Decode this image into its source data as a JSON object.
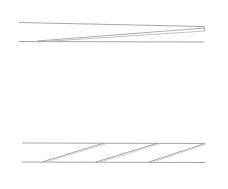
{
  "document": {
    "title": "Technical Line Drawing",
    "width": 228,
    "height": 189,
    "background_color": "#ffffff",
    "stroke_color": "#8d8d8d",
    "stroke_color_light": "#b4b4b4",
    "stroke_color_faint": "#c8c8c8"
  },
  "figures": [
    {
      "name": "upper-band",
      "description": "Two near-horizontal rules spanning the width with a shallow diagonal converging toward the right end",
      "elements": [
        {
          "name": "upper-band-top-rule",
          "type": "line",
          "x1": 19,
          "y1": 22.5,
          "x2": 204,
          "y2": 26.5,
          "color": "#8d8d8d",
          "width": 0.8
        },
        {
          "name": "upper-band-bottom-rule",
          "type": "line",
          "x1": 19,
          "y1": 41.5,
          "x2": 204,
          "y2": 42.0,
          "color": "#8d8d8d",
          "width": 0.8
        },
        {
          "name": "upper-band-diagonal-upper",
          "type": "line",
          "x1": 37,
          "y1": 41.0,
          "x2": 205,
          "y2": 28.0,
          "color": "#9a9a9a",
          "width": 0.8
        },
        {
          "name": "upper-band-diagonal-lower",
          "type": "line",
          "x1": 37,
          "y1": 42.0,
          "x2": 205,
          "y2": 31.0,
          "color": "#b4b4b4",
          "width": 0.8
        },
        {
          "name": "upper-band-right-cap",
          "type": "line",
          "x1": 204,
          "y1": 26.5,
          "x2": 205,
          "y2": 31.0,
          "color": "#9a9a9a",
          "width": 0.8
        }
      ]
    },
    {
      "name": "lower-band",
      "description": "Two horizontal rules enclosing three parallel diagonal hatch strokes rising left to right",
      "elements": [
        {
          "name": "lower-band-top-rule",
          "type": "line",
          "x1": 22,
          "y1": 143.0,
          "x2": 205,
          "y2": 143.5,
          "color": "#8d8d8d",
          "width": 0.8
        },
        {
          "name": "lower-band-bottom-rule",
          "type": "line",
          "x1": 22,
          "y1": 162.0,
          "x2": 205,
          "y2": 162.5,
          "color": "#8d8d8d",
          "width": 0.8
        },
        {
          "name": "lower-band-hatch-1",
          "type": "line",
          "x1": 42,
          "y1": 162.0,
          "x2": 104,
          "y2": 143.0,
          "color": "#9a9a9a",
          "width": 0.9
        },
        {
          "name": "lower-band-hatch-2",
          "type": "line",
          "x1": 96,
          "y1": 162.0,
          "x2": 158,
          "y2": 143.0,
          "color": "#9a9a9a",
          "width": 0.9
        },
        {
          "name": "lower-band-hatch-3",
          "type": "line",
          "x1": 149,
          "y1": 162.0,
          "x2": 205,
          "y2": 143.5,
          "color": "#9a9a9a",
          "width": 0.9
        },
        {
          "name": "lower-band-hatch-1-shadow",
          "type": "line",
          "x1": 45,
          "y1": 162.4,
          "x2": 106,
          "y2": 143.8,
          "color": "#c8c8c8",
          "width": 0.8
        },
        {
          "name": "lower-band-hatch-2-shadow",
          "type": "line",
          "x1": 99,
          "y1": 162.4,
          "x2": 160,
          "y2": 143.8,
          "color": "#c8c8c8",
          "width": 0.8
        },
        {
          "name": "lower-band-hatch-3-shadow",
          "type": "line",
          "x1": 152,
          "y1": 162.4,
          "x2": 206,
          "y2": 144.2,
          "color": "#c8c8c8",
          "width": 0.8
        }
      ]
    }
  ]
}
